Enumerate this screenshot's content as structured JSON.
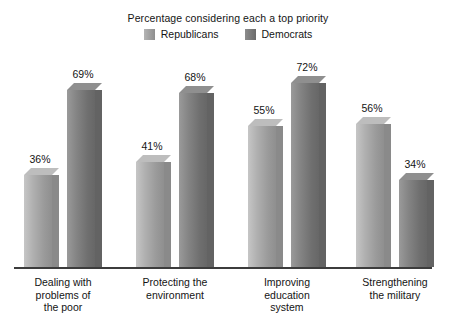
{
  "chart_data": {
    "type": "bar",
    "title": "Percentage considering each a top priority",
    "xlabel": "",
    "ylabel": "",
    "ylim": [
      0,
      80
    ],
    "grid": false,
    "legend_position": "top-center",
    "categories": [
      "Dealing with problems of the poor",
      "Protecting the environment",
      "Improving education system",
      "Strengthening the military"
    ],
    "category_lines": [
      [
        "Dealing with",
        "problems of",
        "the poor"
      ],
      [
        "Protecting the",
        "environment"
      ],
      [
        "Improving",
        "education",
        "system"
      ],
      [
        "Strengthening",
        "the military"
      ]
    ],
    "series": [
      {
        "name": "Republicans",
        "color": "#b0b0b0",
        "values": [
          36,
          41,
          55,
          56
        ],
        "labels": [
          "36%",
          "41%",
          "55%",
          "56%"
        ]
      },
      {
        "name": "Democrats",
        "color": "#7a7a7a",
        "values": [
          69,
          68,
          72,
          34
        ],
        "labels": [
          "69%",
          "68%",
          "72%",
          "34%"
        ]
      }
    ]
  },
  "legend": {
    "entries": [
      {
        "label": "Republicans",
        "swatch": "republicans-swatch"
      },
      {
        "label": "Democrats",
        "swatch": "democrats-swatch"
      }
    ]
  }
}
